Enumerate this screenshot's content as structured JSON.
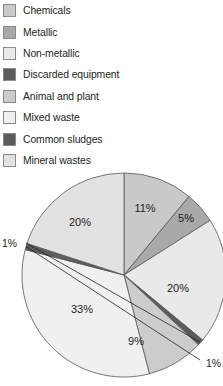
{
  "legend": {
    "items": [
      {
        "label": "Chemicals",
        "color": "#c9c9c9"
      },
      {
        "label": "Metallic",
        "color": "#a9a9a9"
      },
      {
        "label": "Non-metallic",
        "color": "#e9e9e9"
      },
      {
        "label": "Discarded equipment",
        "color": "#5c5c5c"
      },
      {
        "label": "Animal and plant",
        "color": "#cccccc"
      },
      {
        "label": "Mixed waste",
        "color": "#f0f0f0"
      },
      {
        "label": "Common sludges",
        "color": "#5c5c5c"
      },
      {
        "label": "Mineral wastes",
        "color": "#e2e2e2"
      }
    ]
  },
  "chart_data": {
    "type": "pie",
    "title": "",
    "legend_position": "top",
    "start_angle_deg": 0,
    "direction": "clockwise",
    "categories": [
      "Chemicals",
      "Metallic",
      "Non-metallic",
      "Common sludges",
      "Animal and plant",
      "Mixed waste",
      "Discarded equipment",
      "Mineral wastes"
    ],
    "values": [
      11,
      5,
      20,
      1,
      9,
      33,
      1,
      20
    ],
    "unit": "%",
    "labels": [
      "11%",
      "5%",
      "20%",
      "1%",
      "9%",
      "33%",
      "1%",
      "20%"
    ],
    "colors": [
      "#c9c9c9",
      "#a9a9a9",
      "#e9e9e9",
      "#5c5c5c",
      "#cccccc",
      "#f0f0f0",
      "#5c5c5c",
      "#e2e2e2"
    ],
    "slice_label_text": {
      "chemicals": "11%",
      "metallic": "5%",
      "non_metallic": "20%",
      "common_sludges": "1%",
      "animal_and_plant": "9%",
      "mixed_waste": "33%",
      "discarded_equipment": "1%",
      "mineral_wastes": "20%"
    }
  }
}
